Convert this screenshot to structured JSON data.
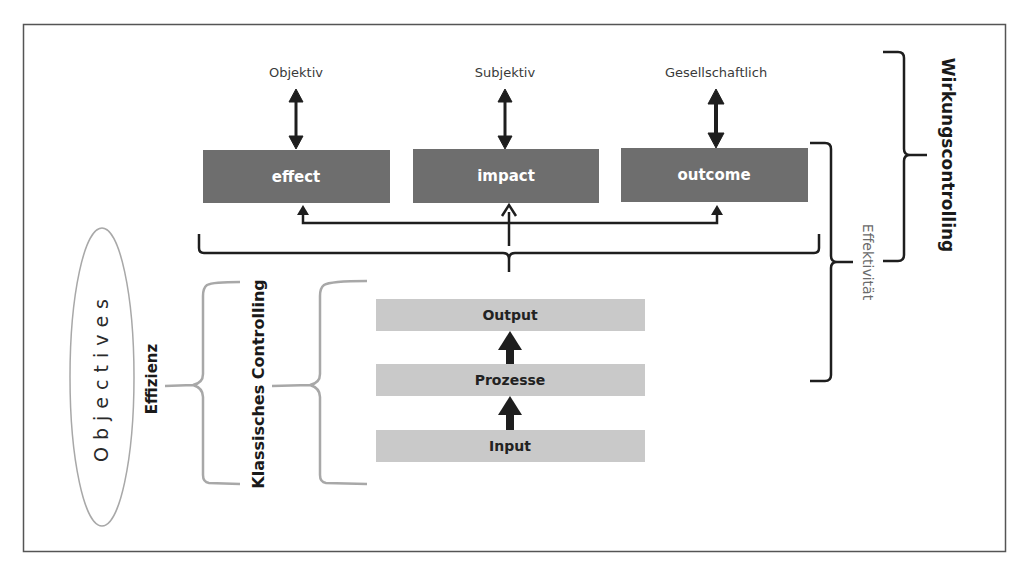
{
  "diagram": {
    "top_labels": [
      "Objektiv",
      "Subjektiv",
      "Gesellschaftlich"
    ],
    "result_boxes": [
      "effect",
      "impact",
      "outcome"
    ],
    "process_boxes": [
      "Output",
      "Prozesse",
      "Input"
    ],
    "right_labels": {
      "wirkungscontrolling": "Wirkungscontrolling",
      "effektivitaet": "Effektivität"
    },
    "left_labels": {
      "objectives": "Objectives",
      "effizienz": "Effizienz",
      "klassisches_controlling": "Klassisches Controlling"
    },
    "colors": {
      "result_box": "#6e6e6e",
      "process_box": "#c9c9c9",
      "line_dark": "#1e1e1e",
      "brace_gray": "#a8a8a8",
      "frame": "#555555"
    }
  }
}
